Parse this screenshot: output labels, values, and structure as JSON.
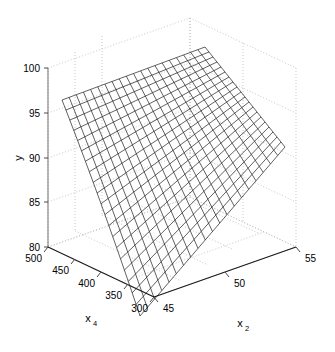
{
  "chart_data": {
    "type": "surface",
    "title": "",
    "xlabel": "x_2",
    "ylabel": "x_4",
    "zlabel": "y",
    "axes": {
      "z": {
        "name": "y",
        "label_text": "y",
        "ticks": [
          80,
          85,
          90,
          95,
          100
        ],
        "ticklabels": [
          "80",
          "85",
          "90",
          "95",
          "100"
        ],
        "range": [
          80,
          100
        ]
      },
      "y": {
        "name": "x_4",
        "label_base": "x",
        "label_sub": "4",
        "ticks": [
          300,
          350,
          400,
          450,
          500
        ],
        "ticklabels": [
          "500",
          "450",
          "400",
          "350",
          "300"
        ],
        "range": [
          300,
          500
        ]
      },
      "x": {
        "name": "x_2",
        "label_base": "x",
        "label_sub": "2",
        "ticks": [
          45,
          50,
          55
        ],
        "ticklabels": [
          "45",
          "50",
          "55"
        ],
        "range": [
          45,
          55
        ]
      }
    },
    "mesh": {
      "nx": 20,
      "ny": 20,
      "line_color": "#000000",
      "face_color": "#ffffff",
      "description": "warped planar response surface, rises toward high x_2 / high x_4 corner"
    },
    "corners": {
      "x45_x4_500": 95.0,
      "x55_x4_500": 100.5,
      "x45_x4_300": 79.0,
      "x55_x4_300": 90.5
    },
    "grid": "dotted",
    "grid_color": "#b8b8b8",
    "background": "#ffffff",
    "legend": null
  }
}
